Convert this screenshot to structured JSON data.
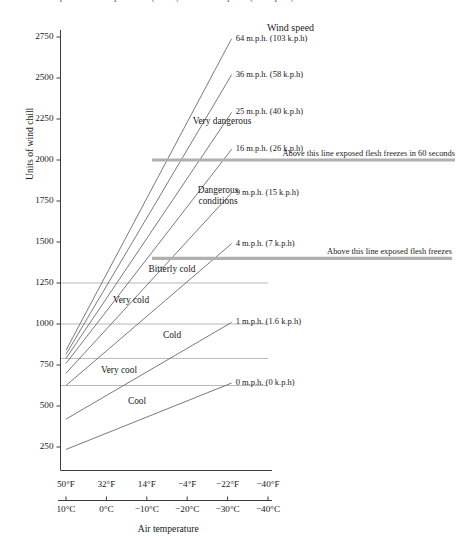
{
  "caption": {
    "top_text_partial": "equivalent temperature (in °F) and wind speed (in m.p.h.)"
  },
  "chart_data": {
    "type": "line",
    "title": "",
    "xlabel": "Air temperature",
    "ylabel": "Units of wind chill",
    "legend_title": "Wind speed",
    "legend_position": "right",
    "grid": true,
    "x_axis": {
      "fahrenheit_ticks": [
        "50°F",
        "32°F",
        "14°F",
        "−4°F",
        "−22°F",
        "−40°F"
      ],
      "celsius_ticks": [
        "10°C",
        "0°C",
        "−10°C",
        "−20°C",
        "−30°C",
        "−40°C"
      ],
      "fahrenheit_values": [
        50,
        32,
        14,
        -4,
        -22,
        -40
      ],
      "celsius_values": [
        10,
        0,
        -10,
        -20,
        -30,
        -40
      ]
    },
    "y_axis": {
      "ticks": [
        250,
        500,
        750,
        1000,
        1250,
        1500,
        1750,
        2000,
        2250,
        2500,
        2750
      ],
      "tick_labels": [
        "250",
        "500",
        "750",
        "1000",
        "1250",
        "1500",
        "1750",
        "2000",
        "2250",
        "2500",
        "2750"
      ],
      "ylim": [
        100,
        2800
      ]
    },
    "series": [
      {
        "name": "64 m.p.h. (103 k.p.h)",
        "mph": 64,
        "kph": 103,
        "x_start_c": 10,
        "y_start": 840,
        "x_end_c": -31,
        "y_end": 2740
      },
      {
        "name": "36 m.p.h. (58 k.p.h)",
        "mph": 36,
        "kph": 58,
        "x_start_c": 10,
        "y_start": 815,
        "x_end_c": -31,
        "y_end": 2520
      },
      {
        "name": "25 m.p.h. (40 k.p.h)",
        "mph": 25,
        "kph": 40,
        "x_start_c": 10,
        "y_start": 790,
        "x_end_c": -31,
        "y_end": 2290
      },
      {
        "name": "16 m.p.h. (26 k.p.h)",
        "mph": 16,
        "kph": 26,
        "x_start_c": 10,
        "y_start": 760,
        "x_end_c": -31,
        "y_end": 2065
      },
      {
        "name": "9 m.p.h. (15 k.p.h)",
        "mph": 9,
        "kph": 15,
        "x_start_c": 10,
        "y_start": 700,
        "x_end_c": -31,
        "y_end": 1800
      },
      {
        "name": "4 m.p.h. (7 k.p.h)",
        "mph": 4,
        "kph": 7,
        "x_start_c": 10,
        "y_start": 625,
        "x_end_c": -31,
        "y_end": 1490
      },
      {
        "name": "1 m.p.h. (1.6 k.p.h)",
        "mph": 1,
        "kph": 1.6,
        "x_start_c": 10,
        "y_start": 420,
        "x_end_c": -31,
        "y_end": 1010
      },
      {
        "name": "0 m.p.h. (0 k.p.h)",
        "mph": 0,
        "kph": 0,
        "x_start_c": 10,
        "y_start": 235,
        "x_end_c": -31,
        "y_end": 640
      }
    ],
    "zone_bands": [
      {
        "label": "Very dangerous",
        "y": 2195
      },
      {
        "label": "Dangerous conditions",
        "y": 1775
      },
      {
        "label": "Bitterly cold",
        "y": 1330
      },
      {
        "label": "Very cold",
        "y": 1140
      },
      {
        "label": "Cold",
        "y": 925
      },
      {
        "label": "Very cool",
        "y": 715
      },
      {
        "label": "Cool",
        "y": 525
      }
    ],
    "zone_gridlines": [
      1250,
      1000,
      790,
      625
    ],
    "threshold_lines": [
      {
        "y": 2000,
        "label": "Above this line exposed flesh freezes in 60 seconds"
      },
      {
        "y": 1400,
        "label": "Above this line exposed flesh freezes"
      }
    ]
  },
  "colors": {
    "axis": "#3c3c3c",
    "series_line": "#6b6b6b",
    "gridline": "#b9b9b9",
    "threshold": "#b0b0b0",
    "text": "#1a1a1a"
  }
}
